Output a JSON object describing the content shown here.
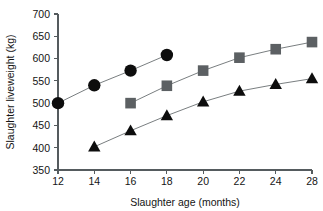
{
  "chart_data": {
    "type": "line",
    "title": "",
    "xlabel": "Slaughter age (months)",
    "ylabel": "Slaughter liveweight (kg)",
    "categories": [
      "12",
      "14",
      "16",
      "18",
      "20",
      "22",
      "24",
      "28"
    ],
    "x": [
      12,
      14,
      16,
      18,
      20,
      22,
      24,
      28
    ],
    "xtick_labels": [
      "12",
      "14",
      "16",
      "18",
      "20",
      "22",
      "24",
      "28"
    ],
    "ytick_labels": [
      "350",
      "400",
      "450",
      "500",
      "550",
      "600",
      "650",
      "700"
    ],
    "yticks": [
      350,
      400,
      450,
      500,
      550,
      600,
      650,
      700
    ],
    "ylim": [
      350,
      700
    ],
    "grid": false,
    "legend": "none",
    "series": [
      {
        "name": "circle-series",
        "marker": "circle",
        "color": "#0d0d0d",
        "points": [
          {
            "x": 12,
            "y": 500
          },
          {
            "x": 14,
            "y": 540
          },
          {
            "x": 16,
            "y": 573
          },
          {
            "x": 18,
            "y": 608
          }
        ]
      },
      {
        "name": "square-series",
        "marker": "square",
        "color": "#5c6063",
        "points": [
          {
            "x": 16,
            "y": 500
          },
          {
            "x": 18,
            "y": 539
          },
          {
            "x": 20,
            "y": 573
          },
          {
            "x": 22,
            "y": 602
          },
          {
            "x": 24,
            "y": 621
          },
          {
            "x": 28,
            "y": 637
          }
        ]
      },
      {
        "name": "triangle-series",
        "marker": "triangle",
        "color": "#0d0d0d",
        "points": [
          {
            "x": 14,
            "y": 402
          },
          {
            "x": 16,
            "y": 438
          },
          {
            "x": 18,
            "y": 472
          },
          {
            "x": 20,
            "y": 503
          },
          {
            "x": 22,
            "y": 527
          },
          {
            "x": 24,
            "y": 542
          },
          {
            "x": 28,
            "y": 555
          }
        ]
      }
    ]
  },
  "layout": {
    "plot_left": 58,
    "plot_right": 312,
    "plot_top": 14,
    "plot_bottom": 170,
    "tick_len": 4,
    "marker_circle_r": 6.2,
    "marker_square_s": 10.6,
    "marker_triangle_s": 12.4,
    "axis_color": "#555b5e",
    "line_color": "#6a6f72"
  }
}
